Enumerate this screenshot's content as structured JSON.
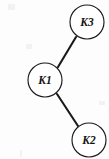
{
  "figure": {
    "type": "node-link-diagram",
    "background_color": "#fdfdfd",
    "stroke_color": "#1a1a1a",
    "width": 109,
    "height": 159
  },
  "graph": {
    "node_radius": 17,
    "nodes": [
      {
        "id": "K3",
        "label": "K3",
        "cx": 87,
        "cy": 22
      },
      {
        "id": "K1",
        "label": "K1",
        "cx": 45,
        "cy": 80
      },
      {
        "id": "K2",
        "label": "K2",
        "cx": 89,
        "cy": 140
      }
    ],
    "edges": [
      {
        "id": "edge-k1-k3",
        "from": "K1",
        "to": "K3",
        "x1": 58,
        "y1": 67,
        "x2": 76,
        "y2": 37
      },
      {
        "id": "edge-k1-k2",
        "from": "K1",
        "to": "K2",
        "x1": 57,
        "y1": 94,
        "x2": 78,
        "y2": 126
      }
    ]
  }
}
